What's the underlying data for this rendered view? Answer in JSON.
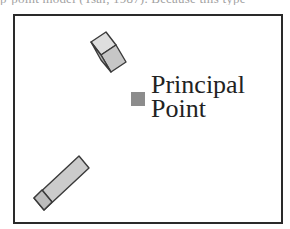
{
  "page": {
    "cut_off_text_above": "p-point model (Tsai, 1987). Because this type"
  },
  "diagram": {
    "type": "camera-image-plane",
    "frame": {
      "stroke": "#2a2a2a"
    },
    "principal_point": {
      "label_line1": "Principal",
      "label_line2": "Point",
      "marker_color": "#8c8c8c"
    },
    "objects": [
      {
        "name": "upper-block",
        "shape": "tilted rectangular prism",
        "fill": "#c8c8c8",
        "stroke": "#3a3a3a"
      },
      {
        "name": "lower-block",
        "shape": "elongated tilted rectangular prism",
        "fill": "#c8c8c8",
        "stroke": "#3a3a3a"
      }
    ]
  }
}
